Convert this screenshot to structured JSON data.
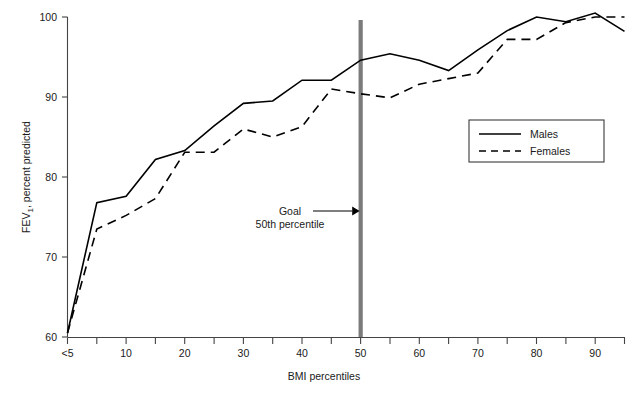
{
  "chart_data": {
    "type": "line",
    "title": "",
    "xlabel": "BMI percentiles",
    "ylabel": "FEV1, percent predicted",
    "ylabel_base": "FEV",
    "ylabel_sub": "1",
    "ylabel_rest": ", percent predicted",
    "xlim": [
      0,
      95
    ],
    "ylim": [
      60,
      100
    ],
    "grid": false,
    "ytick_values": [
      60,
      70,
      80,
      90,
      100
    ],
    "ytick_labels": [
      "60",
      "70",
      "80",
      "90",
      "100"
    ],
    "xtick_values": [
      0,
      5,
      10,
      15,
      20,
      25,
      30,
      35,
      40,
      45,
      50,
      55,
      60,
      65,
      70,
      75,
      80,
      85,
      90,
      95
    ],
    "xtick_labels": [
      "<5",
      "",
      "10",
      "",
      "20",
      "",
      "30",
      "",
      "40",
      "",
      "50",
      "",
      "60",
      "",
      "70",
      "",
      "80",
      "",
      "90",
      ""
    ],
    "x": [
      0,
      5,
      10,
      15,
      20,
      25,
      30,
      35,
      40,
      45,
      50,
      55,
      60,
      65,
      70,
      75,
      80,
      85,
      90,
      95
    ],
    "series": [
      {
        "name": "Males",
        "style": "solid",
        "color": "#000000",
        "values": [
          60.5,
          76.8,
          77.6,
          82.2,
          83.3,
          86.4,
          89.2,
          89.5,
          92.1,
          92.1,
          94.6,
          95.4,
          94.6,
          93.3,
          95.9,
          98.3,
          100.0,
          99.4,
          100.5,
          98.2
        ]
      },
      {
        "name": "Females",
        "style": "dashed",
        "color": "#000000",
        "values": [
          60.5,
          73.5,
          75.2,
          77.3,
          83.1,
          83.1,
          86.0,
          85.0,
          86.3,
          91.0,
          90.4,
          89.9,
          91.6,
          92.3,
          93.0,
          97.2,
          97.2,
          99.3,
          100.0,
          100.0
        ]
      }
    ],
    "legend": {
      "position": "right-middle",
      "entries": [
        {
          "label": "Males",
          "style": "solid"
        },
        {
          "label": "Females",
          "style": "dashed"
        }
      ]
    },
    "annotations": [
      {
        "name": "goal-marker",
        "line1": "Goal",
        "line2": "50th percentile",
        "x_value": 50,
        "color": "#7b7b7b",
        "arrow": true
      }
    ]
  }
}
